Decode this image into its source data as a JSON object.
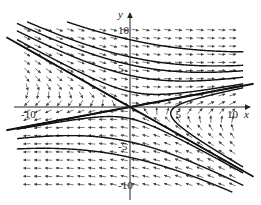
{
  "chart_data": {
    "type": "vector_field",
    "title": "",
    "xlabel": "x",
    "ylabel": "y",
    "xlim": [
      -11,
      11
    ],
    "ylim": [
      -11,
      11
    ],
    "grid": false,
    "x_ticks": [
      {
        "value": -10,
        "label": "-10"
      },
      {
        "value": 5,
        "label": "5"
      },
      {
        "value": 10,
        "label": "10"
      }
    ],
    "y_ticks": [
      {
        "value": 10,
        "label": "10"
      },
      {
        "value": 5,
        "label": "5"
      },
      {
        "value": -5,
        "label": "-5"
      },
      {
        "value": -10,
        "label": "-10"
      }
    ],
    "equilibrium": {
      "x": 0,
      "y": 0,
      "type": "saddle"
    },
    "eigen_directions": [
      {
        "direction": [
          1,
          0.25
        ],
        "behavior": "unstable (outgoing)"
      },
      {
        "direction": [
          1,
          -0.75
        ],
        "behavior": "stable (incoming)"
      }
    ],
    "trajectory_count": 9
  },
  "axes": {
    "x_label": "x",
    "y_label": "y"
  },
  "colors": {
    "curve": "#111111",
    "arrow": "#444444",
    "axis": "#222222",
    "background": "#ffffff"
  }
}
